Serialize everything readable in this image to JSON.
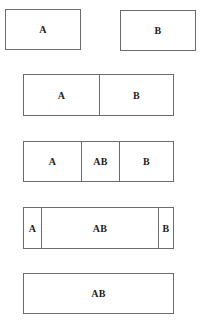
{
  "diagram": {
    "rows": [
      {
        "id": "separate",
        "boxes": [
          {
            "left": 5,
            "top": 9,
            "width": 76,
            "height": 41,
            "cells": [
              {
                "label": "A",
                "width": 74
              }
            ]
          },
          {
            "left": 120,
            "top": 10,
            "width": 76,
            "height": 41,
            "cells": [
              {
                "label": "B",
                "width": 74
              }
            ]
          }
        ]
      },
      {
        "id": "adjacent",
        "boxes": [
          {
            "left": 23,
            "top": 74,
            "width": 151,
            "height": 42,
            "cells": [
              {
                "label": "A",
                "width": 75
              },
              {
                "label": "B",
                "width": 74
              }
            ]
          }
        ]
      },
      {
        "id": "partial-overlap",
        "boxes": [
          {
            "left": 23,
            "top": 141,
            "width": 151,
            "height": 41,
            "cells": [
              {
                "label": "A",
                "width": 57
              },
              {
                "label": "AB",
                "width": 38
              },
              {
                "label": "B",
                "width": 54
              }
            ]
          }
        ]
      },
      {
        "id": "large-overlap",
        "boxes": [
          {
            "left": 23,
            "top": 207,
            "width": 151,
            "height": 42,
            "cells": [
              {
                "label": "A",
                "width": 17
              },
              {
                "label": "AB",
                "width": 117
              },
              {
                "label": "B",
                "width": 15
              }
            ]
          }
        ]
      },
      {
        "id": "full-overlap",
        "boxes": [
          {
            "left": 23,
            "top": 273,
            "width": 151,
            "height": 41,
            "cells": [
              {
                "label": "AB",
                "width": 149
              }
            ]
          }
        ]
      }
    ]
  },
  "labels": {
    "r1_a": "A",
    "r1_b": "B",
    "r2_a": "A",
    "r2_b": "B",
    "r3_a": "A",
    "r3_ab": "AB",
    "r3_b": "B",
    "r4_a": "A",
    "r4_ab": "AB",
    "r4_b": "B",
    "r5_ab": "AB"
  },
  "colors": {
    "border": "#6b6b6b",
    "text": "#222222",
    "background": "#ffffff"
  }
}
